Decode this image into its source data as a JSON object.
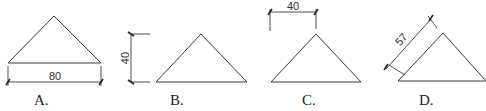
{
  "options": [
    {
      "label": "A.",
      "dimension": "80",
      "dimension_type": "horizontal-base"
    },
    {
      "label": "B.",
      "dimension": "40",
      "dimension_type": "vertical-height"
    },
    {
      "label": "C.",
      "dimension": "40",
      "dimension_type": "horizontal-half-base"
    },
    {
      "label": "D.",
      "dimension": "57",
      "dimension_type": "aligned-side"
    }
  ]
}
